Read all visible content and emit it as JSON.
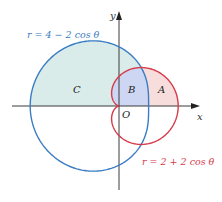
{
  "diagram": {
    "type": "polar-curves",
    "origin_px": [
      119,
      106
    ],
    "scale_px_per_unit": 14.8,
    "axes": {
      "x_label": "x",
      "y_label": "y",
      "origin_label": "O",
      "color": "#3a3a3a"
    },
    "curves": [
      {
        "id": "blue",
        "equation": "r = 4 − 2 cos θ",
        "a": 4,
        "b": -2,
        "color": "#3a7cc3"
      },
      {
        "id": "red",
        "equation": "r = 2 + 2 cos θ",
        "a": 2,
        "b": 2,
        "color": "#d63a4a"
      }
    ],
    "regions": [
      {
        "label": "A",
        "description": "inside red, outside blue",
        "fill": "#f7dedd"
      },
      {
        "label": "B",
        "description": "inside both curves",
        "fill": "#cdd6f2"
      },
      {
        "label": "C",
        "description": "inside blue, outside red, upper half",
        "fill": "#d9ecea"
      }
    ],
    "labels": {
      "blue_equation": "r = 4 − 2 cos θ",
      "red_equation": "r = 2 + 2 cos θ",
      "region_a": "A",
      "region_b": "B",
      "region_c": "C"
    }
  }
}
